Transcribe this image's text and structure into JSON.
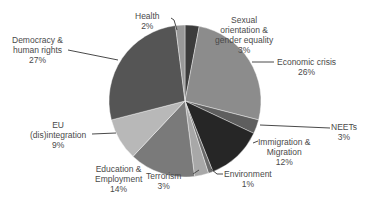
{
  "chart_data": {
    "type": "pie",
    "title": "",
    "start_angle_deg": 0,
    "direction": "clockwise",
    "slices": [
      {
        "label": "Sexual orientation & gender equality",
        "value": 3,
        "pct": "3%",
        "color": "#3c3c3c"
      },
      {
        "label": "Economic crisis",
        "value": 26,
        "pct": "26%",
        "color": "#8c8c8c"
      },
      {
        "label": "NEETs",
        "value": 3,
        "pct": "3%",
        "color": "#5e5e5e"
      },
      {
        "label": "Immigration & Migration",
        "value": 12,
        "pct": "12%",
        "color": "#262626"
      },
      {
        "label": "Environment",
        "value": 1,
        "pct": "1%",
        "color": "#6a6a6a"
      },
      {
        "label": "Terrorism",
        "value": 3,
        "pct": "3%",
        "color": "#a8a8a8"
      },
      {
        "label": "Education & Employment",
        "value": 14,
        "pct": "14%",
        "color": "#7a7a7a"
      },
      {
        "label": "EU (dis)integration",
        "value": 9,
        "pct": "9%",
        "color": "#b8b8b8"
      },
      {
        "label": "Democracy & human rights",
        "value": 27,
        "pct": "27%",
        "color": "#555555"
      },
      {
        "label": "Health",
        "value": 2,
        "pct": "2%",
        "color": "#999999"
      }
    ],
    "legend": "none (data labels with leader lines)"
  },
  "labels": {
    "sexual": {
      "l1": "Sexual",
      "l2": "orientation &",
      "l3": "gender equality",
      "pct": "3%"
    },
    "economic": {
      "l1": "Economic crisis",
      "pct": "26%"
    },
    "neets": {
      "l1": "NEETs",
      "pct": "3%"
    },
    "immigration": {
      "l1": "Immigration &",
      "l2": "Migration",
      "pct": "12%"
    },
    "environment": {
      "l1": "Environment",
      "pct": "1%"
    },
    "terrorism": {
      "l1": "Terrorism",
      "pct": "3%"
    },
    "education": {
      "l1": "Education &",
      "l2": "Employment",
      "pct": "14%"
    },
    "eu": {
      "l1": "EU",
      "l2": "(dis)integration",
      "pct": "9%"
    },
    "democracy": {
      "l1": "Democracy &",
      "l2": "human rights",
      "pct": "27%"
    },
    "health": {
      "l1": "Health",
      "pct": "2%"
    }
  }
}
